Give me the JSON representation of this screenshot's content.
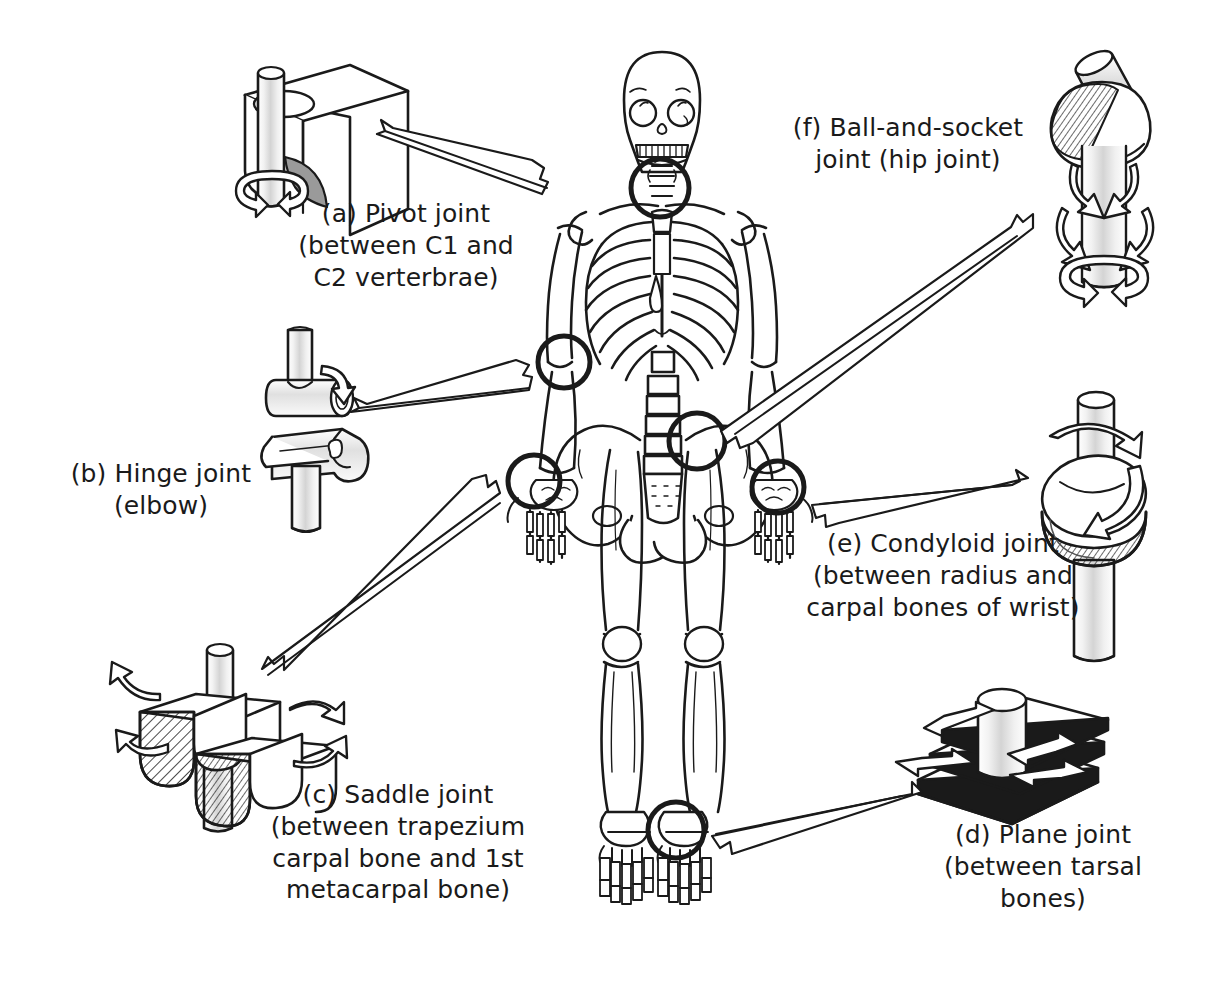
{
  "figure": {
    "background_color": "#ffffff",
    "ink_color": "#1a1a1a",
    "width": 1218,
    "height": 989
  },
  "labels": {
    "a": "(a) Pivot joint\n(between C1 and\nC2 verterbrae)",
    "b": "(b) Hinge joint\n(elbow)",
    "c": "(c) Saddle joint\n(between trapezium\ncarpal bone and 1st\nmetacarpal bone)",
    "d": "(d) Plane joint\n(between tarsal bones)",
    "e": "(e) Condyloid joint\n(between radius and\ncarpal bones of wrist)",
    "f": "(f) Ball-and-socket\njoint (hip joint)"
  },
  "joints": [
    {
      "key": "a",
      "letter": "(a)",
      "name": "Pivot joint",
      "location": "between C1 and C2 verterbrae",
      "model": "cylinder-through-block",
      "callout_target": "cervical-vertebrae-highlight"
    },
    {
      "key": "b",
      "letter": "(b)",
      "name": "Hinge joint",
      "location": "elbow",
      "model": "cylinder-in-trough",
      "callout_target": "elbow-highlight"
    },
    {
      "key": "c",
      "letter": "(c)",
      "name": "Saddle joint",
      "location": "between trapezium carpal bone and 1st metacarpal bone",
      "model": "saddle-blocks",
      "callout_target": "left-wrist-highlight"
    },
    {
      "key": "d",
      "letter": "(d)",
      "name": "Plane joint",
      "location": "between tarsal bones",
      "model": "cylinder-on-gliding-plates",
      "callout_target": "ankle-highlight"
    },
    {
      "key": "e",
      "letter": "(e)",
      "name": "Condyloid joint",
      "location": "between radius and carpal bones of wrist",
      "model": "ellipsoid-in-oval-socket",
      "callout_target": "right-wrist-highlight"
    },
    {
      "key": "f",
      "letter": "(f)",
      "name": "Ball-and-socket joint",
      "location": "hip joint",
      "model": "ball-in-socket",
      "callout_target": "hip-highlight"
    }
  ],
  "skeleton": {
    "highlight_circles": [
      {
        "name": "cervical-vertebrae-highlight",
        "cx": 660,
        "cy": 188,
        "r": 29
      },
      {
        "name": "elbow-highlight",
        "cx": 564,
        "cy": 362,
        "r": 26
      },
      {
        "name": "left-wrist-highlight",
        "cx": 534,
        "cy": 481,
        "r": 26
      },
      {
        "name": "hip-highlight",
        "cx": 697,
        "cy": 441,
        "r": 28
      },
      {
        "name": "right-wrist-highlight",
        "cx": 778,
        "cy": 487,
        "r": 26
      },
      {
        "name": "ankle-highlight",
        "cx": 676,
        "cy": 830,
        "r": 28
      }
    ]
  }
}
